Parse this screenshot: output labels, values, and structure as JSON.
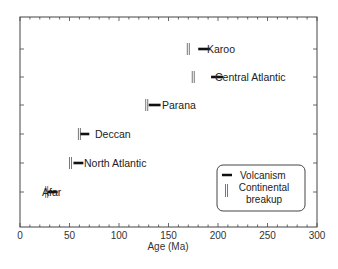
{
  "chart_data": {
    "type": "range-markers",
    "title": "",
    "xlabel": "Age (Ma)",
    "ylabel": "",
    "xlim": [
      0,
      300
    ],
    "xticks": [
      0,
      50,
      100,
      150,
      200,
      250,
      300
    ],
    "xtick_labels": [
      "0",
      "50",
      "100",
      "150",
      "200",
      "250",
      "300"
    ],
    "grid": false,
    "legend_position": "lower right",
    "legend": [
      {
        "name": "Volcanism",
        "marker": "horizontal-bar",
        "color": "#111111"
      },
      {
        "name": "Continental breakup",
        "marker": "double-vertical-bar",
        "color": "#888888"
      }
    ],
    "categories": [
      "Karoo",
      "Central Atlantic",
      "Parana",
      "Deccan",
      "North Atlantic",
      "Afar"
    ],
    "series": [
      {
        "name": "Continental breakup",
        "values": [
          170,
          175,
          128,
          60,
          51,
          27
        ]
      },
      {
        "name": "Volcanism",
        "ranges": [
          [
            180,
            192
          ],
          [
            193,
            205
          ],
          [
            130,
            142
          ],
          [
            61,
            70
          ],
          [
            54,
            64
          ],
          [
            28,
            38
          ]
        ]
      }
    ],
    "label_x": [
      207,
      215,
      162,
      95,
      84,
      42
    ]
  },
  "axis": {
    "x_title": "Age (Ma)",
    "ticks": [
      "0",
      "50",
      "100",
      "150",
      "200",
      "250",
      "300"
    ]
  },
  "rows": [
    {
      "label": "Karoo"
    },
    {
      "label": "Central Atlantic"
    },
    {
      "label": "Parana"
    },
    {
      "label": "Deccan"
    },
    {
      "label": "North Atlantic"
    },
    {
      "label": "Afar"
    }
  ],
  "legend": {
    "volcanism": "Volcanism",
    "breakup_line1": "Continental",
    "breakup_line2": "breakup"
  }
}
